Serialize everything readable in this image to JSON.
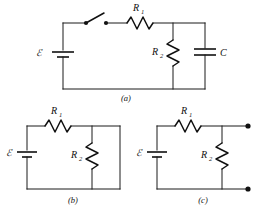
{
  "figure": {
    "background_color": "#ffffff",
    "line_color": "#111111"
  },
  "panels": [
    {
      "id": "a",
      "caption": "(a)",
      "description": "Full RC circuit with open switch, EMF source, series R1, parallel R2 and capacitor C",
      "components": [
        {
          "type": "emf-source",
          "label": "ℰ"
        },
        {
          "type": "switch",
          "label": "",
          "state": "open"
        },
        {
          "type": "resistor",
          "label": "R",
          "subscript": "1",
          "orientation": "horizontal"
        },
        {
          "type": "resistor",
          "label": "R",
          "subscript": "2",
          "orientation": "vertical"
        },
        {
          "type": "capacitor",
          "label": "C",
          "orientation": "vertical"
        }
      ]
    },
    {
      "id": "b",
      "caption": "(b)",
      "description": "Closed loop with EMF source, series R1 and parallel R2",
      "components": [
        {
          "type": "emf-source",
          "label": "ℰ"
        },
        {
          "type": "resistor",
          "label": "R",
          "subscript": "1",
          "orientation": "horizontal"
        },
        {
          "type": "resistor",
          "label": "R",
          "subscript": "2",
          "orientation": "vertical"
        }
      ]
    },
    {
      "id": "c",
      "caption": "(c)",
      "description": "EMF source with series R1 and parallel R2 feeding two open output terminals",
      "components": [
        {
          "type": "emf-source",
          "label": "ℰ"
        },
        {
          "type": "resistor",
          "label": "R",
          "subscript": "1",
          "orientation": "horizontal"
        },
        {
          "type": "resistor",
          "label": "R",
          "subscript": "2",
          "orientation": "vertical"
        },
        {
          "type": "terminal",
          "label": "",
          "position": "top-right"
        },
        {
          "type": "terminal",
          "label": "",
          "position": "bottom-right"
        }
      ]
    }
  ],
  "labels": {
    "emf": "ℰ",
    "r_base": "R",
    "r1_sub": "1",
    "r2_sub": "2",
    "capacitor": "C",
    "caption_a": "(a)",
    "caption_b": "(b)",
    "caption_c": "(c)"
  }
}
